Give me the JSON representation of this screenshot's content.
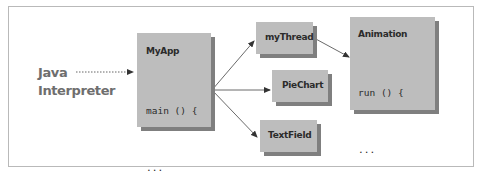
{
  "diagram": {
    "source_label": [
      "Java",
      "Interpreter"
    ],
    "boxes": {
      "myapp": {
        "title": "MyApp",
        "code": [
          "main () {",
          "...",
          "}"
        ]
      },
      "mythread": {
        "title": "myThread"
      },
      "piechart": {
        "title": "PieChart"
      },
      "textfield": {
        "title": "TextField"
      },
      "animation": {
        "title": "Animation",
        "code": [
          "run () {",
          "...",
          "}"
        ]
      }
    },
    "edges": [
      {
        "from": "Java Interpreter",
        "to": "MyApp",
        "style": "dotted"
      },
      {
        "from": "MyApp",
        "to": "myThread",
        "style": "solid"
      },
      {
        "from": "MyApp",
        "to": "PieChart",
        "style": "solid"
      },
      {
        "from": "MyApp",
        "to": "TextField",
        "style": "solid"
      },
      {
        "from": "myThread",
        "to": "Animation",
        "style": "solid"
      }
    ],
    "colors": {
      "box_fill": "#bdbdbd",
      "box_shadow": "#7f7f7f",
      "label_text": "#6e6e6e",
      "border": "#b9b9b9"
    }
  }
}
